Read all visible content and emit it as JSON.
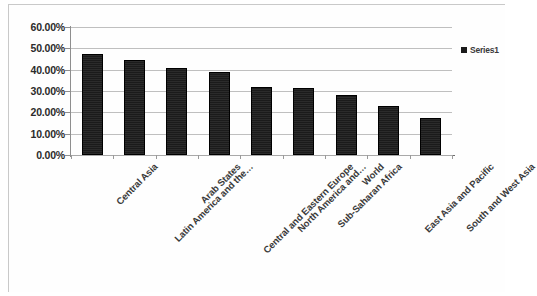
{
  "chart_data": {
    "type": "bar",
    "title": "",
    "xlabel": "",
    "ylabel": "",
    "ylim": [
      0,
      60
    ],
    "ytick_labels": [
      "60.00%",
      "50.00%",
      "40.00%",
      "30.00%",
      "20.00%",
      "10.00%",
      "0.00%"
    ],
    "ytick_values": [
      60,
      50,
      40,
      30,
      20,
      10,
      0
    ],
    "grid": true,
    "legend_position": "right",
    "categories": [
      "Central Asia",
      "Latin America and the…",
      "Arab States",
      "Central and Eastern Europe",
      "North America and…",
      "Sub-Saharan Africa",
      "World",
      "East Asia and Pacific",
      "South and West Asia"
    ],
    "series": [
      {
        "name": "Series1",
        "values": [
          47.5,
          44.5,
          41.0,
          39.0,
          32.0,
          31.5,
          28.0,
          23.0,
          17.5
        ]
      }
    ],
    "bar_color": "#1b1b1b"
  },
  "legend": {
    "entries": [
      {
        "label": "Series1",
        "color": "#1b1b1b"
      }
    ]
  }
}
